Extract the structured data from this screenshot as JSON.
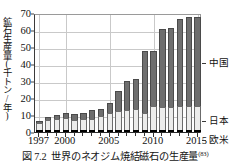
{
  "figure": {
    "caption_number": "図 7.2",
    "caption_text": "世界のネオジム焼結磁石の生産量",
    "caption_ref": "(83)"
  },
  "axes": {
    "y_title": "鉱石生産量(千トン/年)",
    "y_ticks": [
      "0",
      "10",
      "20",
      "30",
      "40",
      "50",
      "60",
      "70"
    ],
    "x_ticks": [
      "1997",
      "2000",
      "2005",
      "2010",
      "2015"
    ]
  },
  "legend": {
    "china": "中国",
    "japan": "日本",
    "west": "欧米"
  },
  "colors": {
    "china": "#6e6e6e",
    "japan": "#ececeb",
    "west": "#1f1f1f",
    "grid": "#c9c9c9",
    "axis": "#2b2b2b"
  },
  "chart_data": {
    "type": "bar",
    "stacked": true,
    "title": "世界のネオジム焼結磁石の生産量",
    "xlabel": "",
    "ylabel": "鉱石生産量(千トン/年)",
    "ylim": [
      0,
      70
    ],
    "ytick_step": 10,
    "grid": true,
    "legend_position": "right",
    "categories": [
      "1997",
      "1998",
      "1999",
      "2000",
      "2001",
      "2002",
      "2003",
      "2004",
      "2005",
      "2006",
      "2007",
      "2008",
      "2009",
      "2010",
      "2011",
      "2012",
      "2013",
      "2014",
      "2015"
    ],
    "series": [
      {
        "name": "欧米",
        "values": [
          0.8,
          0.8,
          0.8,
          0.8,
          0.7,
          0.7,
          0.7,
          0.7,
          0.7,
          0.6,
          0.6,
          0.6,
          0.6,
          0.6,
          0.6,
          0.6,
          0.6,
          0.6,
          0.6
        ]
      },
      {
        "name": "日本",
        "values": [
          4.2,
          6.0,
          6.2,
          6.8,
          6.0,
          6.2,
          6.4,
          8.4,
          10.0,
          11.4,
          12.0,
          12.2,
          10.2,
          14.0,
          13.4,
          13.3,
          14.0,
          14.2,
          14.2
        ]
      },
      {
        "name": "中国",
        "values": [
          1.0,
          1.4,
          2.6,
          3.4,
          3.6,
          3.8,
          5.2,
          3.8,
          5.6,
          11.6,
          16.8,
          17.6,
          35.8,
          32.4,
          45.5,
          46.3,
          51.2,
          51.8,
          52.1
        ]
      }
    ],
    "totals": [
      6.0,
      8.2,
      9.6,
      11.0,
      10.3,
      10.7,
      12.3,
      12.9,
      16.3,
      23.6,
      29.4,
      30.4,
      46.6,
      47.0,
      59.5,
      60.2,
      65.8,
      66.6,
      66.9
    ]
  }
}
